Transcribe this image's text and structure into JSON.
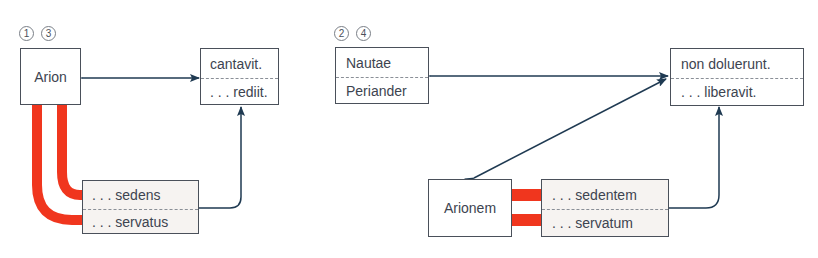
{
  "colors": {
    "line": "#1f3a52",
    "red": "#f0361e",
    "box_border": "#4a505a",
    "shaded_box": "#f6f3f1",
    "text": "#3d4450"
  },
  "left_diagram": {
    "markers": [
      "1",
      "3"
    ],
    "subject_box": {
      "label": "Arion"
    },
    "predicate_box": {
      "top": "cantavit.",
      "bottom": ". . . rediit."
    },
    "participle_box": {
      "top": ". . . sedens",
      "bottom": ". . . servatus"
    }
  },
  "right_diagram": {
    "markers": [
      "2",
      "4"
    ],
    "subject_box": {
      "top": "Nautae",
      "bottom": "Periander"
    },
    "predicate_box": {
      "top": "non doluerunt.",
      "bottom": ". . . liberavit."
    },
    "object_box": {
      "label": "Arionem"
    },
    "participle_box": {
      "top": ". . . sedentem",
      "bottom": ". . . servatum"
    }
  }
}
